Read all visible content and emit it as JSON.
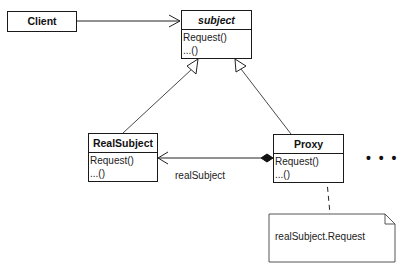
{
  "diagram": {
    "type": "UML class diagram",
    "classes": {
      "client": {
        "name": "Client"
      },
      "subject": {
        "name": "subject",
        "abstract": true,
        "operations": [
          "Request()",
          "...()"
        ]
      },
      "real_subject": {
        "name": "RealSubject",
        "operations": [
          "Request()",
          "...()"
        ]
      },
      "proxy": {
        "name": "Proxy",
        "operations": [
          "Request()",
          "...()"
        ]
      }
    },
    "relations": {
      "client_to_subject": {
        "kind": "association",
        "from": "Client",
        "to": "subject"
      },
      "real_subject_inherits": {
        "kind": "generalization",
        "from": "RealSubject",
        "to": "subject"
      },
      "proxy_inherits": {
        "kind": "generalization",
        "from": "Proxy",
        "to": "subject"
      },
      "proxy_to_real_subject": {
        "kind": "composition",
        "from": "Proxy",
        "to": "RealSubject",
        "label": "realSubject"
      }
    },
    "note": {
      "text": "realSubject.Request",
      "attached_to": "Proxy.Request()"
    },
    "ellipsis": "• • •"
  }
}
